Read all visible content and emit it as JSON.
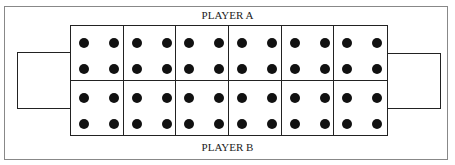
{
  "labels": {
    "top": "PLAYER A",
    "bottom": "PLAYER B"
  },
  "board": {
    "pits_per_row": 6,
    "rows": [
      {
        "player": "A",
        "pits": [
          4,
          4,
          4,
          4,
          4,
          4
        ]
      },
      {
        "player": "B",
        "pits": [
          4,
          4,
          4,
          4,
          4,
          4
        ]
      }
    ],
    "stores": {
      "left": 0,
      "right": 0
    }
  },
  "colors": {
    "line": "#222222",
    "seed": "#111111",
    "frame": "#888888"
  }
}
